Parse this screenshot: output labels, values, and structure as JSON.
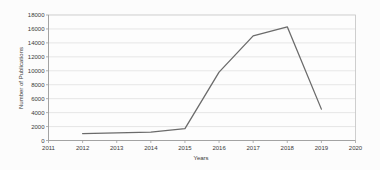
{
  "chart_data": {
    "type": "line",
    "title": "",
    "xlabel": "Years",
    "ylabel": "Number of Publications",
    "x": [
      2012,
      2013,
      2014,
      2015,
      2016,
      2017,
      2018,
      2019
    ],
    "values": [
      1000,
      1100,
      1200,
      1700,
      9800,
      15000,
      16300,
      4500
    ],
    "series_name": "Number of Publications",
    "xlim": [
      2011,
      2020
    ],
    "ylim": [
      0,
      18000
    ],
    "xticks": [
      2011,
      2012,
      2013,
      2014,
      2015,
      2016,
      2017,
      2018,
      2019,
      2020
    ],
    "yticks": [
      0,
      2000,
      4000,
      6000,
      8000,
      10000,
      12000,
      14000,
      16000,
      18000
    ],
    "grid": "horizontal",
    "legend": "none",
    "colors": {
      "line": "#6b6b6b",
      "gridline": "#dcdcdc",
      "frame": "#c2c2c2",
      "axis": "#9e9e9e",
      "text": "#3a3a3a",
      "plot_background": "#fdfdfd"
    }
  }
}
